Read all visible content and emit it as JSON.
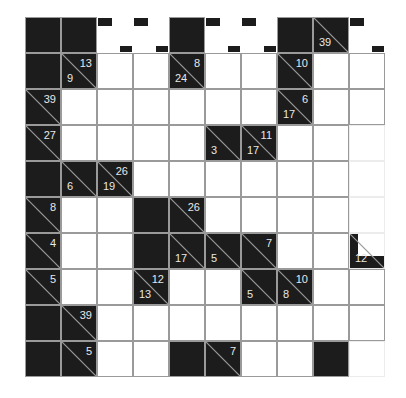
{
  "puzzle": {
    "type": "kakuro",
    "rows": 10,
    "cols": 10,
    "colors": {
      "block": "#1c1c1c",
      "grid_line": "#9a9a9a",
      "clue_text": "#e8e8e8",
      "empty": "#ffffff"
    },
    "grid": [
      [
        {
          "t": "B"
        },
        {
          "t": "B"
        },
        {
          "t": "O"
        },
        {
          "t": "O"
        },
        {
          "t": "B"
        },
        {
          "t": "O"
        },
        {
          "t": "O"
        },
        {
          "t": "B"
        },
        {
          "t": "C",
          "down": "39"
        },
        {
          "t": "O"
        }
      ],
      [
        {
          "t": "B"
        },
        {
          "t": "C",
          "across": "13",
          "down": "9"
        },
        {
          "t": "W"
        },
        {
          "t": "W"
        },
        {
          "t": "C",
          "across": "8",
          "down": "24"
        },
        {
          "t": "W"
        },
        {
          "t": "W"
        },
        {
          "t": "C",
          "across": "10"
        },
        {
          "t": "W"
        },
        {
          "t": "W"
        }
      ],
      [
        {
          "t": "C",
          "across": "39"
        },
        {
          "t": "W"
        },
        {
          "t": "W"
        },
        {
          "t": "W"
        },
        {
          "t": "W"
        },
        {
          "t": "W"
        },
        {
          "t": "W"
        },
        {
          "t": "C",
          "across": "6",
          "down": "17"
        },
        {
          "t": "W"
        },
        {
          "t": "W"
        }
      ],
      [
        {
          "t": "C",
          "across": "27"
        },
        {
          "t": "W"
        },
        {
          "t": "W"
        },
        {
          "t": "W"
        },
        {
          "t": "W"
        },
        {
          "t": "C",
          "down": "3"
        },
        {
          "t": "C",
          "across": "11",
          "down": "17"
        },
        {
          "t": "W"
        },
        {
          "t": "W"
        },
        {
          "t": "F"
        }
      ],
      [
        {
          "t": "B"
        },
        {
          "t": "C",
          "down": "6"
        },
        {
          "t": "C",
          "across": "26",
          "down": "19"
        },
        {
          "t": "W"
        },
        {
          "t": "W"
        },
        {
          "t": "W"
        },
        {
          "t": "W"
        },
        {
          "t": "W"
        },
        {
          "t": "W"
        },
        {
          "t": "F"
        }
      ],
      [
        {
          "t": "C",
          "across": "8"
        },
        {
          "t": "W"
        },
        {
          "t": "W"
        },
        {
          "t": "B"
        },
        {
          "t": "C",
          "across": "26"
        },
        {
          "t": "W"
        },
        {
          "t": "W"
        },
        {
          "t": "W"
        },
        {
          "t": "W"
        },
        {
          "t": "F"
        }
      ],
      [
        {
          "t": "C",
          "across": "4"
        },
        {
          "t": "W"
        },
        {
          "t": "W"
        },
        {
          "t": "B"
        },
        {
          "t": "C",
          "down": "17"
        },
        {
          "t": "C",
          "down": "5"
        },
        {
          "t": "C",
          "across": "7"
        },
        {
          "t": "W"
        },
        {
          "t": "W"
        },
        {
          "t": "P",
          "down": "12"
        }
      ],
      [
        {
          "t": "C",
          "across": "5"
        },
        {
          "t": "W"
        },
        {
          "t": "W"
        },
        {
          "t": "C",
          "across": "12",
          "down": "13"
        },
        {
          "t": "W"
        },
        {
          "t": "W"
        },
        {
          "t": "C",
          "down": "5"
        },
        {
          "t": "C",
          "across": "10",
          "down": "8"
        },
        {
          "t": "W"
        },
        {
          "t": "W"
        }
      ],
      [
        {
          "t": "B"
        },
        {
          "t": "C",
          "across": "39"
        },
        {
          "t": "W"
        },
        {
          "t": "W"
        },
        {
          "t": "W"
        },
        {
          "t": "W"
        },
        {
          "t": "W"
        },
        {
          "t": "W"
        },
        {
          "t": "W"
        },
        {
          "t": "W"
        }
      ],
      [
        {
          "t": "B"
        },
        {
          "t": "C",
          "across": "5"
        },
        {
          "t": "W"
        },
        {
          "t": "W"
        },
        {
          "t": "B"
        },
        {
          "t": "C",
          "across": "7"
        },
        {
          "t": "W"
        },
        {
          "t": "W"
        },
        {
          "t": "B"
        },
        {
          "t": "F"
        }
      ]
    ]
  }
}
